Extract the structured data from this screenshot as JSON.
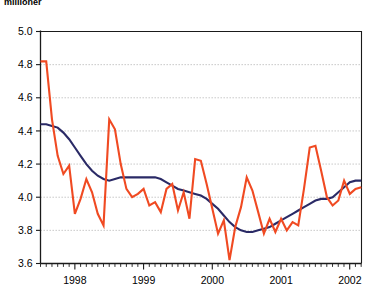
{
  "chart_title": "millioner",
  "chart_data": {
    "type": "line",
    "title": "millioner",
    "xlabel": "",
    "ylabel": "",
    "ylim": [
      3.6,
      5.0
    ],
    "xlim": [
      1997.5,
      2002.17
    ],
    "grid": true,
    "legend": false,
    "y_ticks": [
      "5.0",
      "4.8",
      "4.6",
      "4.4",
      "4.2",
      "4.0",
      "3.8",
      "3.6"
    ],
    "y_tick_values": [
      5.0,
      4.8,
      4.6,
      4.4,
      4.2,
      4.0,
      3.8,
      3.6
    ],
    "x_ticks": [
      "1998",
      "1999",
      "2000",
      "2001",
      "2002"
    ],
    "x_tick_values": [
      1998,
      1999,
      2000,
      2001,
      2002
    ],
    "x_minor_step": 0.0833,
    "colors": {
      "series_1": "#2a2a66",
      "series_2": "#f04a22",
      "grid": "#9a9a9a",
      "axis": "#1a1a1a"
    },
    "x": [
      1997.5,
      1997.583,
      1997.667,
      1997.75,
      1997.833,
      1997.917,
      1998.0,
      1998.083,
      1998.167,
      1998.25,
      1998.333,
      1998.417,
      1998.5,
      1998.583,
      1998.667,
      1998.75,
      1998.833,
      1998.917,
      1999.0,
      1999.083,
      1999.167,
      1999.25,
      1999.333,
      1999.417,
      1999.5,
      1999.583,
      1999.667,
      1999.75,
      1999.833,
      1999.917,
      2000.0,
      2000.083,
      2000.167,
      2000.25,
      2000.333,
      2000.417,
      2000.5,
      2000.583,
      2000.667,
      2000.75,
      2000.833,
      2000.917,
      2001.0,
      2001.083,
      2001.167,
      2001.25,
      2001.333,
      2001.417,
      2001.5,
      2001.583,
      2001.667,
      2001.75,
      2001.833,
      2001.917,
      2002.0,
      2002.083,
      2002.167
    ],
    "series": [
      {
        "name": "trend",
        "color": "#2a2a66",
        "style": "solid",
        "width": 2.1,
        "values": [
          4.44,
          4.44,
          4.43,
          4.42,
          4.39,
          4.35,
          4.3,
          4.25,
          4.2,
          4.16,
          4.13,
          4.11,
          4.1,
          4.11,
          4.12,
          4.12,
          4.12,
          4.12,
          4.12,
          4.12,
          4.12,
          4.11,
          4.09,
          4.07,
          4.05,
          4.04,
          4.03,
          4.02,
          4.01,
          3.99,
          3.96,
          3.93,
          3.89,
          3.85,
          3.82,
          3.8,
          3.79,
          3.79,
          3.8,
          3.81,
          3.82,
          3.84,
          3.86,
          3.88,
          3.9,
          3.92,
          3.94,
          3.96,
          3.98,
          3.99,
          3.99,
          4.0,
          4.03,
          4.06,
          4.09,
          4.1,
          4.1
        ]
      },
      {
        "name": "observed",
        "color": "#f04a22",
        "style": "solid",
        "width": 2.1,
        "values": [
          4.82,
          4.82,
          4.47,
          4.25,
          4.14,
          4.19,
          3.9,
          3.99,
          4.11,
          4.03,
          3.9,
          3.83,
          4.47,
          4.41,
          4.2,
          4.05,
          4.0,
          4.02,
          4.05,
          3.95,
          3.97,
          3.91,
          4.05,
          4.08,
          3.92,
          4.03,
          3.87,
          4.23,
          4.22,
          4.08,
          3.93,
          3.78,
          3.86,
          3.62,
          3.82,
          3.94,
          4.12,
          4.04,
          3.91,
          3.78,
          3.87,
          3.79,
          3.87,
          3.8,
          3.85,
          3.83,
          4.05,
          4.3,
          4.31,
          4.16,
          4.0,
          3.95,
          3.98,
          4.1,
          4.02,
          4.05,
          4.06
        ]
      }
    ]
  }
}
